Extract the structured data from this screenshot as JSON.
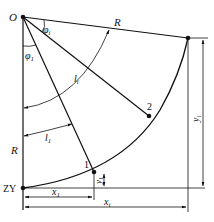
{
  "diagram": {
    "type": "circular-curve-deflection-layout",
    "labels": {
      "center": "O",
      "start_point": "ZY",
      "phi_i": "φ",
      "phi_i_sub": "i",
      "phi_1": "φ",
      "phi_1_sub": "1",
      "radius_top": "R",
      "radius_left": "R",
      "arc_li": "l",
      "arc_li_sub": "i",
      "arc_l1": "l",
      "arc_l1_sub": "1",
      "point_1": "1",
      "point_2": "2",
      "x1": "x",
      "x1_sub": "1",
      "xi": "x",
      "xi_sub": "i",
      "y1": "y",
      "y1_sub": "1",
      "yi": "y",
      "yi_sub": "i"
    },
    "colors": {
      "line": "#111111",
      "background": "#ffffff"
    }
  }
}
